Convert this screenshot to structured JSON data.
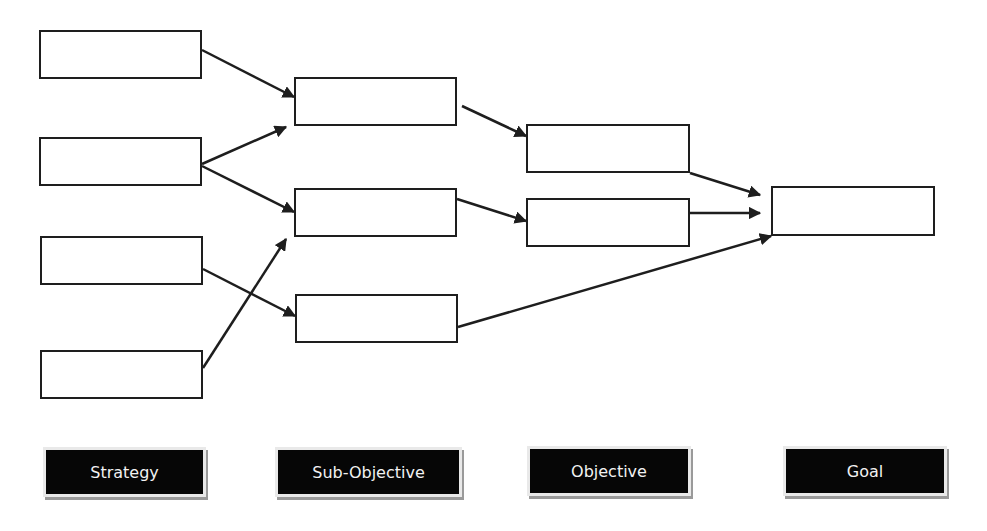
{
  "diagram": {
    "type": "hierarchical flow diagram",
    "colors": {
      "line": "#1e1e1e",
      "label_bg": "#060606",
      "label_text": "#f2f2f2",
      "background": "#ffffff"
    },
    "columns": [
      {
        "id": "strategy",
        "label": "Strategy",
        "box_count": 4
      },
      {
        "id": "sub_objective",
        "label": "Sub-Objective",
        "box_count": 3
      },
      {
        "id": "objective",
        "label": "Objective",
        "box_count": 2
      },
      {
        "id": "goal",
        "label": "Goal",
        "box_count": 1
      }
    ],
    "nodes": [
      {
        "id": "s1",
        "column": "strategy",
        "text": "",
        "x": 39,
        "y": 30,
        "w": 163,
        "h": 49
      },
      {
        "id": "s2",
        "column": "strategy",
        "text": "",
        "x": 39,
        "y": 137,
        "w": 163,
        "h": 49
      },
      {
        "id": "s3",
        "column": "strategy",
        "text": "",
        "x": 40,
        "y": 236,
        "w": 163,
        "h": 49
      },
      {
        "id": "s4",
        "column": "strategy",
        "text": "",
        "x": 40,
        "y": 350,
        "w": 163,
        "h": 49
      },
      {
        "id": "so1",
        "column": "sub_objective",
        "text": "",
        "x": 294,
        "y": 77,
        "w": 163,
        "h": 49
      },
      {
        "id": "so2",
        "column": "sub_objective",
        "text": "",
        "x": 294,
        "y": 188,
        "w": 163,
        "h": 49
      },
      {
        "id": "so3",
        "column": "sub_objective",
        "text": "",
        "x": 295,
        "y": 294,
        "w": 163,
        "h": 49
      },
      {
        "id": "o1",
        "column": "objective",
        "text": "",
        "x": 526,
        "y": 124,
        "w": 164,
        "h": 49
      },
      {
        "id": "o2",
        "column": "objective",
        "text": "",
        "x": 526,
        "y": 198,
        "w": 164,
        "h": 49
      },
      {
        "id": "g1",
        "column": "goal",
        "text": "",
        "x": 771,
        "y": 186,
        "w": 164,
        "h": 50
      }
    ],
    "edges": [
      {
        "from": "s1",
        "to": "so1",
        "x1": 202,
        "y1": 50,
        "x2": 294,
        "y2": 97
      },
      {
        "from": "s2",
        "to": "so1",
        "x1": 202,
        "y1": 164,
        "x2": 286,
        "y2": 127
      },
      {
        "from": "s2",
        "to": "so2",
        "x1": 202,
        "y1": 166,
        "x2": 294,
        "y2": 212
      },
      {
        "from": "s3",
        "to": "so3",
        "x1": 203,
        "y1": 269,
        "x2": 295,
        "y2": 316
      },
      {
        "from": "s4",
        "to": "so2",
        "x1": 203,
        "y1": 368,
        "x2": 286,
        "y2": 239
      },
      {
        "from": "so1",
        "to": "o1",
        "x1": 462,
        "y1": 106,
        "x2": 526,
        "y2": 136
      },
      {
        "from": "so2",
        "to": "o2",
        "x1": 457,
        "y1": 199,
        "x2": 526,
        "y2": 221
      },
      {
        "from": "so3",
        "to": "g1",
        "x1": 458,
        "y1": 327,
        "x2": 771,
        "y2": 236
      },
      {
        "from": "o1",
        "to": "g1",
        "x1": 690,
        "y1": 173,
        "x2": 760,
        "y2": 195
      },
      {
        "from": "o2",
        "to": "g1",
        "x1": 690,
        "y1": 213,
        "x2": 760,
        "y2": 213
      }
    ],
    "labels": [
      {
        "column": "strategy",
        "text": "Strategy",
        "x": 43,
        "y": 447,
        "w": 163,
        "h": 50
      },
      {
        "column": "sub_objective",
        "text": "Sub-Objective",
        "x": 275,
        "y": 447,
        "w": 187,
        "h": 50
      },
      {
        "column": "objective",
        "text": "Objective",
        "x": 527,
        "y": 446,
        "w": 164,
        "h": 50
      },
      {
        "column": "goal",
        "text": "Goal",
        "x": 783,
        "y": 446,
        "w": 164,
        "h": 50
      }
    ]
  }
}
